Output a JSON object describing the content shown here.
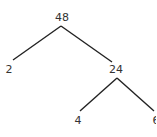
{
  "diagram": {
    "type": "factor-tree",
    "nodes": [
      {
        "id": "n48",
        "label": "48",
        "x": 62,
        "y": 12
      },
      {
        "id": "n2",
        "label": "2",
        "x": 8,
        "y": 64
      },
      {
        "id": "n24",
        "label": "24",
        "x": 116,
        "y": 64
      },
      {
        "id": "n4",
        "label": "4",
        "x": 78,
        "y": 115
      },
      {
        "id": "n6",
        "label": "6",
        "x": 155,
        "y": 115
      }
    ],
    "edges": [
      {
        "from": "n48",
        "to": "n2"
      },
      {
        "from": "n48",
        "to": "n24"
      },
      {
        "from": "n24",
        "to": "n4"
      },
      {
        "from": "n24",
        "to": "n6"
      }
    ],
    "colors": {
      "line": "#222222",
      "text": "#333333",
      "background": "#ffffff"
    }
  }
}
